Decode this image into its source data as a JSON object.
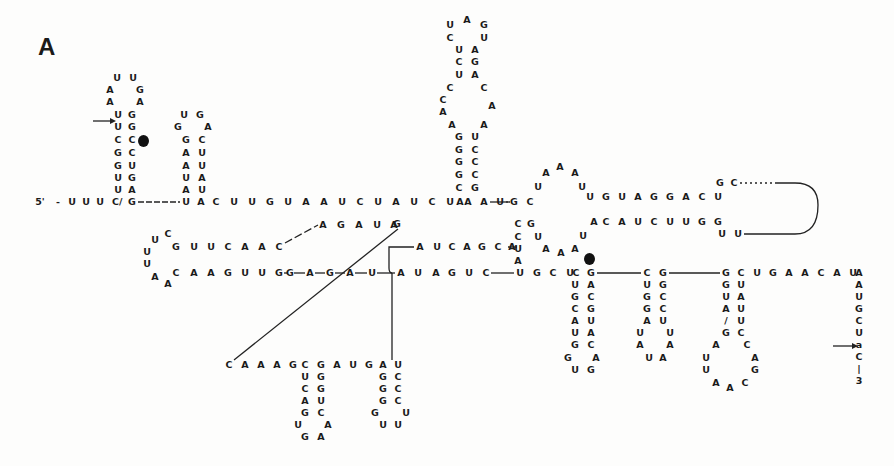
{
  "panel_label": "A",
  "ends": {
    "five_prime": "5'"
  },
  "nucleotides": [
    {
      "c": "U",
      "x": 117,
      "y": 78
    },
    {
      "c": "U",
      "x": 133,
      "y": 78
    },
    {
      "c": "A",
      "x": 110,
      "y": 90
    },
    {
      "c": "G",
      "x": 140,
      "y": 90
    },
    {
      "c": "A",
      "x": 110,
      "y": 102
    },
    {
      "c": "A",
      "x": 140,
      "y": 102
    },
    {
      "c": "U",
      "x": 118,
      "y": 115
    },
    {
      "c": "G",
      "x": 132,
      "y": 115
    },
    {
      "c": "U",
      "x": 118,
      "y": 127
    },
    {
      "c": "G",
      "x": 132,
      "y": 127
    },
    {
      "c": "C",
      "x": 118,
      "y": 140
    },
    {
      "c": "C",
      "x": 132,
      "y": 140
    },
    {
      "c": "G",
      "x": 118,
      "y": 153
    },
    {
      "c": "C",
      "x": 132,
      "y": 153
    },
    {
      "c": "G",
      "x": 118,
      "y": 166
    },
    {
      "c": "U",
      "x": 132,
      "y": 166
    },
    {
      "c": "U",
      "x": 118,
      "y": 178
    },
    {
      "c": "G",
      "x": 132,
      "y": 178
    },
    {
      "c": "U",
      "x": 118,
      "y": 190
    },
    {
      "c": "A",
      "x": 132,
      "y": 190
    },
    {
      "c": "-",
      "x": 58,
      "y": 202
    },
    {
      "c": "U",
      "x": 72,
      "y": 202
    },
    {
      "c": "U",
      "x": 86,
      "y": 202
    },
    {
      "c": "U",
      "x": 100,
      "y": 202
    },
    {
      "c": "C/",
      "x": 117,
      "y": 202
    },
    {
      "c": "G",
      "x": 132,
      "y": 202
    },
    {
      "c": "U",
      "x": 184,
      "y": 115
    },
    {
      "c": "G",
      "x": 200,
      "y": 115
    },
    {
      "c": "G",
      "x": 178,
      "y": 127
    },
    {
      "c": "A",
      "x": 208,
      "y": 127
    },
    {
      "c": "G",
      "x": 186,
      "y": 140
    },
    {
      "c": "C",
      "x": 202,
      "y": 140
    },
    {
      "c": "A",
      "x": 186,
      "y": 153
    },
    {
      "c": "U",
      "x": 202,
      "y": 153
    },
    {
      "c": "A",
      "x": 186,
      "y": 166
    },
    {
      "c": "U",
      "x": 202,
      "y": 166
    },
    {
      "c": "U",
      "x": 186,
      "y": 178
    },
    {
      "c": "A",
      "x": 202,
      "y": 178
    },
    {
      "c": "A",
      "x": 186,
      "y": 190
    },
    {
      "c": "U",
      "x": 202,
      "y": 190
    },
    {
      "c": "U",
      "x": 186,
      "y": 202
    },
    {
      "c": "A",
      "x": 201,
      "y": 202
    },
    {
      "c": "C",
      "x": 216,
      "y": 202
    },
    {
      "c": "U",
      "x": 234,
      "y": 202
    },
    {
      "c": "U",
      "x": 252,
      "y": 202
    },
    {
      "c": "G",
      "x": 270,
      "y": 202
    },
    {
      "c": "U",
      "x": 288,
      "y": 202
    },
    {
      "c": "A",
      "x": 306,
      "y": 202
    },
    {
      "c": "A",
      "x": 324,
      "y": 202
    },
    {
      "c": "U",
      "x": 342,
      "y": 202
    },
    {
      "c": "C",
      "x": 360,
      "y": 202
    },
    {
      "c": "U",
      "x": 378,
      "y": 202
    },
    {
      "c": "A",
      "x": 396,
      "y": 202
    },
    {
      "c": "U",
      "x": 414,
      "y": 202
    },
    {
      "c": "C",
      "x": 432,
      "y": 202
    },
    {
      "c": "U",
      "x": 450,
      "y": 202
    },
    {
      "c": "A",
      "x": 468,
      "y": 202
    },
    {
      "c": "A",
      "x": 484,
      "y": 202
    },
    {
      "c": "A",
      "x": 460,
      "y": 202
    },
    {
      "c": "U",
      "x": 500,
      "y": 202
    },
    {
      "c": "A",
      "x": 467,
      "y": 20
    },
    {
      "c": "U",
      "x": 450,
      "y": 25
    },
    {
      "c": "G",
      "x": 484,
      "y": 25
    },
    {
      "c": "C",
      "x": 450,
      "y": 38
    },
    {
      "c": "U",
      "x": 484,
      "y": 38
    },
    {
      "c": "U",
      "x": 459,
      "y": 50
    },
    {
      "c": "A",
      "x": 475,
      "y": 50
    },
    {
      "c": "C",
      "x": 459,
      "y": 62
    },
    {
      "c": "G",
      "x": 475,
      "y": 62
    },
    {
      "c": "U",
      "x": 459,
      "y": 75
    },
    {
      "c": "A",
      "x": 475,
      "y": 75
    },
    {
      "c": "C",
      "x": 450,
      "y": 88
    },
    {
      "c": "C",
      "x": 484,
      "y": 88
    },
    {
      "c": "C",
      "x": 443,
      "y": 100
    },
    {
      "c": "A",
      "x": 492,
      "y": 106
    },
    {
      "c": "A",
      "x": 443,
      "y": 112
    },
    {
      "c": "A",
      "x": 452,
      "y": 125
    },
    {
      "c": "A",
      "x": 484,
      "y": 125
    },
    {
      "c": "G",
      "x": 459,
      "y": 137
    },
    {
      "c": "U",
      "x": 475,
      "y": 137
    },
    {
      "c": "G",
      "x": 459,
      "y": 150
    },
    {
      "c": "C",
      "x": 475,
      "y": 150
    },
    {
      "c": "G",
      "x": 459,
      "y": 162
    },
    {
      "c": "C",
      "x": 475,
      "y": 162
    },
    {
      "c": "G",
      "x": 459,
      "y": 175
    },
    {
      "c": "C",
      "x": 475,
      "y": 175
    },
    {
      "c": "C",
      "x": 459,
      "y": 188
    },
    {
      "c": "G",
      "x": 475,
      "y": 188
    },
    {
      "c": "G",
      "x": 514,
      "y": 202
    },
    {
      "c": "C",
      "x": 530,
      "y": 202
    },
    {
      "c": "U",
      "x": 538,
      "y": 187
    },
    {
      "c": "A",
      "x": 546,
      "y": 173
    },
    {
      "c": "A",
      "x": 560,
      "y": 167
    },
    {
      "c": "A",
      "x": 575,
      "y": 173
    },
    {
      "c": "U",
      "x": 582,
      "y": 187
    },
    {
      "c": "U",
      "x": 590,
      "y": 197
    },
    {
      "c": "G",
      "x": 606,
      "y": 197
    },
    {
      "c": "U",
      "x": 622,
      "y": 197
    },
    {
      "c": "A",
      "x": 638,
      "y": 197
    },
    {
      "c": "G",
      "x": 654,
      "y": 197
    },
    {
      "c": "G",
      "x": 670,
      "y": 197
    },
    {
      "c": "A",
      "x": 686,
      "y": 197
    },
    {
      "c": "C",
      "x": 702,
      "y": 197
    },
    {
      "c": "U",
      "x": 718,
      "y": 197
    },
    {
      "c": "G",
      "x": 720,
      "y": 183
    },
    {
      "c": "C",
      "x": 734,
      "y": 183
    },
    {
      "c": "C",
      "x": 518,
      "y": 224
    },
    {
      "c": "G",
      "x": 531,
      "y": 224
    },
    {
      "c": "C",
      "x": 518,
      "y": 237
    },
    {
      "c": "U",
      "x": 538,
      "y": 237
    },
    {
      "c": "U",
      "x": 518,
      "y": 249
    },
    {
      "c": "A",
      "x": 546,
      "y": 249
    },
    {
      "c": "A",
      "x": 561,
      "y": 253
    },
    {
      "c": "A",
      "x": 575,
      "y": 249
    },
    {
      "c": "U",
      "x": 583,
      "y": 236
    },
    {
      "c": "A",
      "x": 518,
      "y": 261
    },
    {
      "c": "A",
      "x": 594,
      "y": 222
    },
    {
      "c": "C",
      "x": 606,
      "y": 222
    },
    {
      "c": "A",
      "x": 622,
      "y": 222
    },
    {
      "c": "U",
      "x": 638,
      "y": 222
    },
    {
      "c": "C",
      "x": 654,
      "y": 222
    },
    {
      "c": "U",
      "x": 670,
      "y": 222
    },
    {
      "c": "U",
      "x": 686,
      "y": 222
    },
    {
      "c": "G",
      "x": 702,
      "y": 222
    },
    {
      "c": "G",
      "x": 718,
      "y": 222
    },
    {
      "c": "U",
      "x": 722,
      "y": 234
    },
    {
      "c": "U",
      "x": 738,
      "y": 234
    },
    {
      "c": "A",
      "x": 323,
      "y": 225
    },
    {
      "c": "G",
      "x": 341,
      "y": 225
    },
    {
      "c": "A",
      "x": 359,
      "y": 225
    },
    {
      "c": "U",
      "x": 377,
      "y": 225
    },
    {
      "c": "A",
      "x": 394,
      "y": 225
    },
    {
      "c": "G",
      "x": 397,
      "y": 224
    },
    {
      "c": "C",
      "x": 168,
      "y": 234
    },
    {
      "c": "U",
      "x": 155,
      "y": 240
    },
    {
      "c": "G",
      "x": 176,
      "y": 247
    },
    {
      "c": "U",
      "x": 194,
      "y": 247
    },
    {
      "c": "U",
      "x": 211,
      "y": 247
    },
    {
      "c": "C",
      "x": 228,
      "y": 247
    },
    {
      "c": "A",
      "x": 245,
      "y": 247
    },
    {
      "c": "A",
      "x": 262,
      "y": 247
    },
    {
      "c": "C",
      "x": 279,
      "y": 247
    },
    {
      "c": "U",
      "x": 147,
      "y": 252
    },
    {
      "c": "U",
      "x": 147,
      "y": 264
    },
    {
      "c": "C",
      "x": 176,
      "y": 273
    },
    {
      "c": "A",
      "x": 194,
      "y": 273
    },
    {
      "c": "A",
      "x": 211,
      "y": 273
    },
    {
      "c": "G",
      "x": 228,
      "y": 273
    },
    {
      "c": "U",
      "x": 245,
      "y": 273
    },
    {
      "c": "U",
      "x": 262,
      "y": 273
    },
    {
      "c": "G",
      "x": 279,
      "y": 273
    },
    {
      "c": "A",
      "x": 155,
      "y": 277
    },
    {
      "c": "A",
      "x": 168,
      "y": 284
    },
    {
      "c": "G",
      "x": 290,
      "y": 273
    },
    {
      "c": "A",
      "x": 310,
      "y": 273
    },
    {
      "c": "G",
      "x": 330,
      "y": 273
    },
    {
      "c": "A",
      "x": 350,
      "y": 273
    },
    {
      "c": "U",
      "x": 372,
      "y": 273
    },
    {
      "c": "A",
      "x": 420,
      "y": 247
    },
    {
      "c": "U",
      "x": 437,
      "y": 247
    },
    {
      "c": "C",
      "x": 452,
      "y": 247
    },
    {
      "c": "A",
      "x": 467,
      "y": 247
    },
    {
      "c": "G",
      "x": 482,
      "y": 247
    },
    {
      "c": "C",
      "x": 498,
      "y": 247
    },
    {
      "c": "A",
      "x": 512,
      "y": 247
    },
    {
      "c": "A",
      "x": 401,
      "y": 273
    },
    {
      "c": "U",
      "x": 418,
      "y": 273
    },
    {
      "c": "A",
      "x": 436,
      "y": 273
    },
    {
      "c": "G",
      "x": 452,
      "y": 273
    },
    {
      "c": "U",
      "x": 469,
      "y": 273
    },
    {
      "c": "C",
      "x": 486,
      "y": 273
    },
    {
      "c": "U",
      "x": 520,
      "y": 273
    },
    {
      "c": "G",
      "x": 537,
      "y": 273
    },
    {
      "c": "C",
      "x": 553,
      "y": 273
    },
    {
      "c": "U",
      "x": 570,
      "y": 273
    },
    {
      "c": "C",
      "x": 576,
      "y": 273
    },
    {
      "c": "G",
      "x": 591,
      "y": 273
    },
    {
      "c": "U",
      "x": 575,
      "y": 285
    },
    {
      "c": "A",
      "x": 591,
      "y": 285
    },
    {
      "c": "G",
      "x": 575,
      "y": 297
    },
    {
      "c": "C",
      "x": 591,
      "y": 297
    },
    {
      "c": "C",
      "x": 575,
      "y": 309
    },
    {
      "c": "G",
      "x": 591,
      "y": 309
    },
    {
      "c": "A",
      "x": 575,
      "y": 321
    },
    {
      "c": "U",
      "x": 591,
      "y": 321
    },
    {
      "c": "U",
      "x": 575,
      "y": 333
    },
    {
      "c": "A",
      "x": 591,
      "y": 333
    },
    {
      "c": "G",
      "x": 575,
      "y": 345
    },
    {
      "c": "C",
      "x": 591,
      "y": 345
    },
    {
      "c": "G",
      "x": 568,
      "y": 358
    },
    {
      "c": "A",
      "x": 596,
      "y": 358
    },
    {
      "c": "U",
      "x": 575,
      "y": 370
    },
    {
      "c": "G",
      "x": 591,
      "y": 370
    },
    {
      "c": "C",
      "x": 647,
      "y": 273
    },
    {
      "c": "G",
      "x": 663,
      "y": 273
    },
    {
      "c": "U",
      "x": 647,
      "y": 285
    },
    {
      "c": "G",
      "x": 663,
      "y": 285
    },
    {
      "c": "G",
      "x": 647,
      "y": 297
    },
    {
      "c": "C",
      "x": 663,
      "y": 297
    },
    {
      "c": "G",
      "x": 647,
      "y": 309
    },
    {
      "c": "C",
      "x": 663,
      "y": 309
    },
    {
      "c": "A",
      "x": 647,
      "y": 321
    },
    {
      "c": "U",
      "x": 663,
      "y": 321
    },
    {
      "c": "U",
      "x": 640,
      "y": 333
    },
    {
      "c": "U",
      "x": 670,
      "y": 333
    },
    {
      "c": "A",
      "x": 640,
      "y": 345
    },
    {
      "c": "A",
      "x": 670,
      "y": 345
    },
    {
      "c": "U",
      "x": 649,
      "y": 358
    },
    {
      "c": "A",
      "x": 663,
      "y": 358
    },
    {
      "c": "G",
      "x": 726,
      "y": 273
    },
    {
      "c": "C",
      "x": 741,
      "y": 273
    },
    {
      "c": "U",
      "x": 757,
      "y": 273
    },
    {
      "c": "G",
      "x": 773,
      "y": 273
    },
    {
      "c": "A",
      "x": 789,
      "y": 273
    },
    {
      "c": "A",
      "x": 805,
      "y": 273
    },
    {
      "c": "C",
      "x": 821,
      "y": 273
    },
    {
      "c": "A",
      "x": 837,
      "y": 273
    },
    {
      "c": "U",
      "x": 853,
      "y": 273
    },
    {
      "c": "A",
      "x": 859,
      "y": 273
    },
    {
      "c": "G",
      "x": 726,
      "y": 285
    },
    {
      "c": "U",
      "x": 741,
      "y": 285
    },
    {
      "c": "U",
      "x": 726,
      "y": 297
    },
    {
      "c": "A",
      "x": 741,
      "y": 297
    },
    {
      "c": "A",
      "x": 726,
      "y": 309
    },
    {
      "c": "U",
      "x": 741,
      "y": 309
    },
    {
      "c": "/",
      "x": 726,
      "y": 321
    },
    {
      "c": "U",
      "x": 741,
      "y": 321
    },
    {
      "c": "G",
      "x": 726,
      "y": 333
    },
    {
      "c": "C",
      "x": 741,
      "y": 333
    },
    {
      "c": "A",
      "x": 716,
      "y": 345
    },
    {
      "c": "C",
      "x": 747,
      "y": 345
    },
    {
      "c": "U",
      "x": 706,
      "y": 358
    },
    {
      "c": "A",
      "x": 755,
      "y": 358
    },
    {
      "c": "U",
      "x": 706,
      "y": 370
    },
    {
      "c": "G",
      "x": 755,
      "y": 370
    },
    {
      "c": "A",
      "x": 716,
      "y": 383
    },
    {
      "c": "A",
      "x": 730,
      "y": 388
    },
    {
      "c": "C",
      "x": 745,
      "y": 383
    },
    {
      "c": "A",
      "x": 859,
      "y": 285
    },
    {
      "c": "U",
      "x": 859,
      "y": 297
    },
    {
      "c": "G",
      "x": 859,
      "y": 309
    },
    {
      "c": "C",
      "x": 859,
      "y": 321
    },
    {
      "c": "U",
      "x": 859,
      "y": 333
    },
    {
      "c": "a",
      "x": 859,
      "y": 345
    },
    {
      "c": "C",
      "x": 859,
      "y": 357
    },
    {
      "c": "|",
      "x": 859,
      "y": 369
    },
    {
      "c": "3",
      "x": 859,
      "y": 381
    },
    {
      "c": "C",
      "x": 229,
      "y": 365
    },
    {
      "c": "A",
      "x": 245,
      "y": 365
    },
    {
      "c": "A",
      "x": 261,
      "y": 365
    },
    {
      "c": "A",
      "x": 277,
      "y": 365
    },
    {
      "c": "G",
      "x": 293,
      "y": 365
    },
    {
      "c": "C",
      "x": 305,
      "y": 365
    },
    {
      "c": "G",
      "x": 321,
      "y": 365
    },
    {
      "c": "A",
      "x": 337,
      "y": 365
    },
    {
      "c": "U",
      "x": 353,
      "y": 365
    },
    {
      "c": "G",
      "x": 369,
      "y": 365
    },
    {
      "c": "A",
      "x": 383,
      "y": 365
    },
    {
      "c": "U",
      "x": 398,
      "y": 365
    },
    {
      "c": "U",
      "x": 305,
      "y": 377
    },
    {
      "c": "G",
      "x": 321,
      "y": 377
    },
    {
      "c": "C",
      "x": 305,
      "y": 389
    },
    {
      "c": "G",
      "x": 321,
      "y": 389
    },
    {
      "c": "A",
      "x": 305,
      "y": 401
    },
    {
      "c": "U",
      "x": 321,
      "y": 401
    },
    {
      "c": "G",
      "x": 305,
      "y": 413
    },
    {
      "c": "C",
      "x": 321,
      "y": 413
    },
    {
      "c": "U",
      "x": 298,
      "y": 425
    },
    {
      "c": "A",
      "x": 328,
      "y": 425
    },
    {
      "c": "G",
      "x": 305,
      "y": 437
    },
    {
      "c": "A",
      "x": 321,
      "y": 437
    },
    {
      "c": "G",
      "x": 383,
      "y": 377
    },
    {
      "c": "C",
      "x": 398,
      "y": 377
    },
    {
      "c": "G",
      "x": 383,
      "y": 389
    },
    {
      "c": "C",
      "x": 398,
      "y": 389
    },
    {
      "c": "G",
      "x": 383,
      "y": 401
    },
    {
      "c": "C",
      "x": 398,
      "y": 401
    },
    {
      "c": "G",
      "x": 375,
      "y": 413
    },
    {
      "c": "U",
      "x": 406,
      "y": 413
    },
    {
      "c": "U",
      "x": 383,
      "y": 425
    },
    {
      "c": "U",
      "x": 398,
      "y": 425
    }
  ]
}
